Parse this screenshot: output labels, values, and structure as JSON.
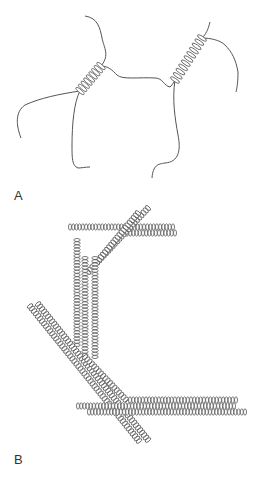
{
  "figure": {
    "panels": [
      {
        "label": "A",
        "description": "Flexible strands joined by short coiled-coil (helical) segments",
        "helices": [
          {
            "x1": 80,
            "y1": 91,
            "x2": 101,
            "y2": 66,
            "turns": 8
          },
          {
            "x1": 175,
            "y1": 80,
            "x2": 202,
            "y2": 38,
            "turns": 10
          }
        ],
        "strands": [
          "M85,16 C98,18 100,28 102,38 C104,48 110,55 101,66",
          "M101,66 C108,66 112,70 117,75 C122,80 140,77 155,78 C163,78 164,86 170,87 C173,84 174,82 175,80",
          "M80,91 C60,94 40,98 25,105 C15,112 16,125 21,138",
          "M80,91 C74,102 72,125 72,145 C72,158 72,166 78,168 C82,168 85,167 90,167",
          "M175,80 C172,100 175,118 178,135 C181,150 179,162 165,163 C158,164 153,165 152,178",
          "M202,38 C206,34 208,30 210,22",
          "M202,38 C210,38 220,40 225,45 C232,52 236,60 238,72 C238,82 237,88 236,92"
        ]
      },
      {
        "label": "B",
        "description": "Coiled-coil rods aggregating into bundles",
        "rods": [
          {
            "x1": 70,
            "y1": 227,
            "x2": 173,
            "y2": 227
          },
          {
            "x1": 127,
            "y1": 233,
            "x2": 175,
            "y2": 233
          },
          {
            "x1": 148,
            "y1": 208,
            "x2": 88,
            "y2": 272
          },
          {
            "x1": 138,
            "y1": 213,
            "x2": 97,
            "y2": 262
          },
          {
            "x1": 77,
            "y1": 240,
            "x2": 77,
            "y2": 345
          },
          {
            "x1": 85,
            "y1": 258,
            "x2": 85,
            "y2": 355
          },
          {
            "x1": 95,
            "y1": 258,
            "x2": 95,
            "y2": 357
          },
          {
            "x1": 30,
            "y1": 306,
            "x2": 139,
            "y2": 441
          },
          {
            "x1": 38,
            "y1": 304,
            "x2": 148,
            "y2": 440
          },
          {
            "x1": 85,
            "y1": 357,
            "x2": 128,
            "y2": 402
          },
          {
            "x1": 130,
            "y1": 400,
            "x2": 236,
            "y2": 400
          },
          {
            "x1": 78,
            "y1": 406,
            "x2": 234,
            "y2": 406
          },
          {
            "x1": 89,
            "y1": 412,
            "x2": 245,
            "y2": 412
          }
        ]
      }
    ],
    "colors": {
      "stroke": "#555555",
      "background": "#ffffff"
    }
  }
}
